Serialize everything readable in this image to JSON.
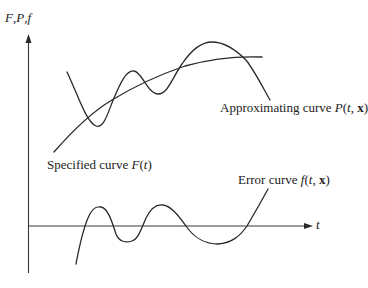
{
  "figure": {
    "y_axis_label": {
      "parts": [
        "F",
        ",",
        "P",
        ",",
        "f"
      ]
    },
    "x_axis_label": "t",
    "labels": {
      "approximating": {
        "text": "Approximating curve ",
        "symbol": "P",
        "open": "(",
        "var": "t",
        "sep": ", ",
        "vec": "x",
        "close": ")"
      },
      "specified": {
        "text": "Specified curve ",
        "symbol": "F",
        "open": "(",
        "var": "t",
        "close": ")"
      },
      "error": {
        "text": "Error curve ",
        "symbol": "f",
        "open": "(",
        "var": "t",
        "sep": ", ",
        "vec": "x",
        "close": ")"
      }
    },
    "curves": [
      {
        "name": "specified-curve",
        "description": "Specified curve F(t): smooth monotonically rising, concave-down"
      },
      {
        "name": "approximating-curve",
        "description": "Approximating curve P(t,x): oscillates around F(t), crossing it multiple times"
      },
      {
        "name": "error-curve",
        "description": "Error curve f(t,x): oscillates about the t-axis"
      }
    ],
    "stroke_color": "#2a2a2a"
  }
}
